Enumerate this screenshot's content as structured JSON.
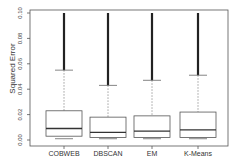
{
  "chart_data": {
    "type": "boxplot",
    "title": "",
    "xlabel": "",
    "ylabel": "Squared Error",
    "ylim": [
      0.0,
      0.1
    ],
    "yticks": [
      "0.00",
      "0.02",
      "0.04",
      "0.06",
      "0.08",
      "0.10"
    ],
    "categories": [
      "COBWEB",
      "DBSCAN",
      "EM",
      "K-Means"
    ],
    "series": [
      {
        "name": "COBWEB",
        "min": 0.001,
        "q1": 0.003,
        "median": 0.009,
        "q3": 0.023,
        "whisker_high": 0.055,
        "outliers_to": 0.1
      },
      {
        "name": "DBSCAN",
        "min": 0.001,
        "q1": 0.002,
        "median": 0.006,
        "q3": 0.018,
        "whisker_high": 0.043,
        "outliers_to": 0.1
      },
      {
        "name": "EM",
        "min": 0.001,
        "q1": 0.002,
        "median": 0.007,
        "q3": 0.019,
        "whisker_high": 0.047,
        "outliers_to": 0.1
      },
      {
        "name": "K-Means",
        "min": 0.001,
        "q1": 0.002,
        "median": 0.008,
        "q3": 0.022,
        "whisker_high": 0.051,
        "outliers_to": 0.1
      }
    ],
    "grid": false,
    "legend": null
  }
}
